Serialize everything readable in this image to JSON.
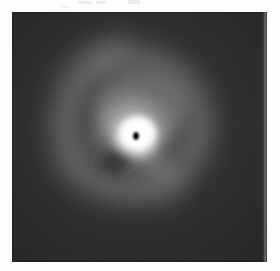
{
  "page": {
    "background_color": "#fdfdfd",
    "width": 280,
    "height": 271
  },
  "plate": {
    "name": "astronomical-image-plate",
    "x": 12,
    "y": 12,
    "width": 255,
    "height": 250,
    "background_color": "#2a2a2a",
    "border_color": "#111111",
    "caption": "",
    "right_edge_strip": true
  },
  "features": {
    "core": {
      "label": "bright-stellar-core",
      "center_x": 136,
      "center_y": 137,
      "radius": 26,
      "peak_color": "#ffffff"
    },
    "occulting_spot": {
      "label": "occulting-mask-spot",
      "center_x": 136,
      "center_y": 136,
      "width": 7,
      "height": 9,
      "color": "#0a0a0a"
    },
    "inner_halo": {
      "label": "inner-halo",
      "center_x": 133,
      "center_y": 130,
      "radius_x": 58,
      "radius_y": 56,
      "color": "#b9b9b9"
    },
    "outer_arc": {
      "label": "outer-spiral-arc",
      "center_x": 132,
      "center_y": 125,
      "radius_x": 86,
      "radius_y": 84,
      "color": "#7e7e7e"
    },
    "dark_notch": {
      "label": "dark-wedge-notch",
      "center_x": 118,
      "center_y": 156,
      "color": "#3a3a3a"
    },
    "southeast_extension": {
      "label": "southeast-faint-extension",
      "color": "#6d6d6d"
    },
    "background_sky": {
      "label": "sky-background",
      "color": "#2d2d2d"
    }
  },
  "artifacts": {
    "label": "scan-artifacts",
    "marks": [
      {
        "x": 78,
        "y": 1,
        "width": 14,
        "height": 3
      },
      {
        "x": 96,
        "y": 1,
        "width": 10,
        "height": 3
      },
      {
        "x": 128,
        "y": 0,
        "width": 12,
        "height": 4
      },
      {
        "x": 62,
        "y": 6,
        "width": 8,
        "height": 2
      }
    ]
  }
}
